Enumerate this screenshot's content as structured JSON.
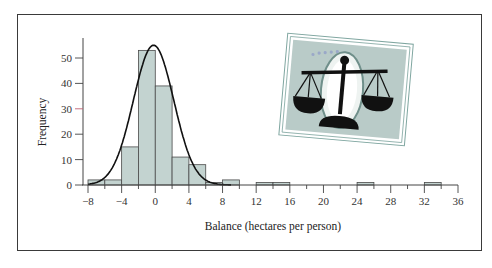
{
  "chart_data": {
    "type": "bar",
    "subtype": "histogram_with_normal_curve",
    "title": "",
    "xlabel": "Balance (hectares per person)",
    "ylabel": "Frequency",
    "xlim": [
      -8,
      36
    ],
    "ylim": [
      0,
      55
    ],
    "x_ticks": [
      -8,
      -4,
      0,
      4,
      8,
      12,
      16,
      20,
      24,
      28,
      32,
      36
    ],
    "x_tick_labels": [
      "−8",
      "−4",
      "0",
      "4",
      "8",
      "12",
      "16",
      "20",
      "24",
      "28",
      "32",
      "36"
    ],
    "y_ticks": [
      0,
      10,
      20,
      30,
      40,
      50
    ],
    "y_tick_labels": [
      "0",
      "10",
      "20",
      "30",
      "40",
      "50"
    ],
    "bin_width": 2,
    "bins": [
      {
        "start": -8,
        "end": -6,
        "count": 2
      },
      {
        "start": -6,
        "end": -4,
        "count": 2
      },
      {
        "start": -4,
        "end": -2,
        "count": 15
      },
      {
        "start": -2,
        "end": 0,
        "count": 53
      },
      {
        "start": 0,
        "end": 2,
        "count": 39
      },
      {
        "start": 2,
        "end": 4,
        "count": 11
      },
      {
        "start": 4,
        "end": 6,
        "count": 8
      },
      {
        "start": 6,
        "end": 8,
        "count": 1
      },
      {
        "start": 8,
        "end": 10,
        "count": 2
      },
      {
        "start": 12,
        "end": 14,
        "count": 1
      },
      {
        "start": 14,
        "end": 16,
        "count": 1
      },
      {
        "start": 24,
        "end": 26,
        "count": 1
      },
      {
        "start": 32,
        "end": 34,
        "count": 1
      }
    ],
    "categories": [
      "-8 to -6",
      "-6 to -4",
      "-4 to -2",
      "-2 to 0",
      "0 to 2",
      "2 to 4",
      "4 to 6",
      "6 to 8",
      "8 to 10",
      "12 to 14",
      "14 to 16",
      "24 to 26",
      "32 to 34"
    ],
    "values": [
      2,
      2,
      15,
      53,
      39,
      11,
      8,
      1,
      2,
      1,
      1,
      1,
      1
    ],
    "overlay": {
      "type": "normal_curve",
      "mean": -0.2,
      "sd": 2.4,
      "peak": 55
    },
    "grid": false,
    "legend": null,
    "colors": {
      "bar_fill": "#c3d3d0",
      "bar_stroke": "#4a4a4a",
      "curve": "#111111",
      "axis": "#444444"
    },
    "inset_image": "scales-of-justice-illustration"
  }
}
